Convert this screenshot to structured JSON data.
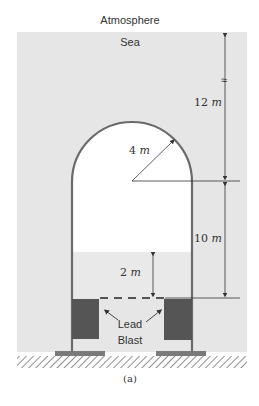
{
  "labels": {
    "atmosphere": "Atmosphere",
    "sea": "Sea",
    "dim_top": "12",
    "dim_radius": "4",
    "dim_middle": "10",
    "dim_bottom": "2",
    "unit": "m",
    "lead": "Lead",
    "blast": "Blast",
    "break_symbol": "≈",
    "caption": "(a)"
  },
  "colors": {
    "sea": "#e6e6e6",
    "interior": "#ffffff",
    "water_inside": "#e9e9e9",
    "wall": "#6a6a6a",
    "lead_blast": "#555555",
    "base": "#7a7a7a",
    "line": "#333333"
  }
}
